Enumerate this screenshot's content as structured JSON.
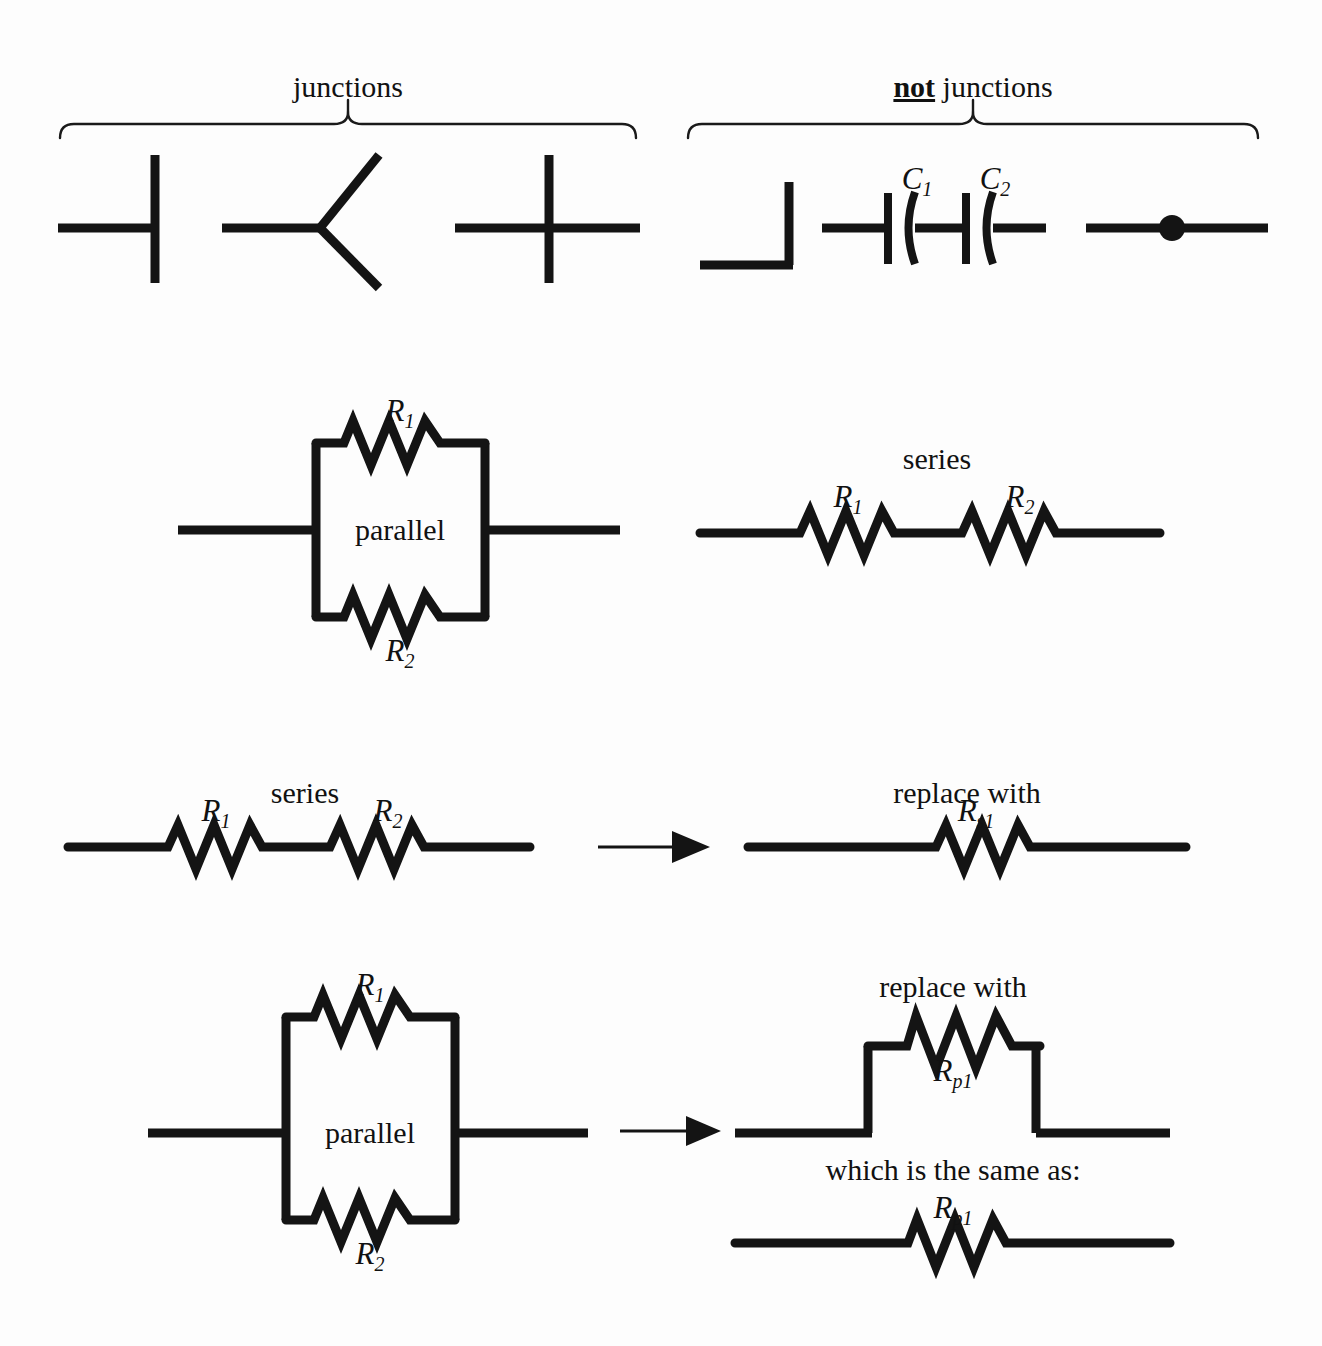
{
  "figure": {
    "title_top_left": "junctions",
    "title_top_right_emphasis": "not",
    "title_top_right_rest": " junctions",
    "background_color": "#fdfdfd",
    "ink_color": "#141414"
  },
  "sections": {
    "junctions": {
      "heading": "junctions",
      "symbols": [
        {
          "name": "t-junction",
          "kind": "tee"
        },
        {
          "name": "y-junction",
          "kind": "wye"
        },
        {
          "name": "cross-junction",
          "kind": "cross"
        }
      ]
    },
    "not_junctions": {
      "heading_emphasis": "not",
      "heading_rest": " junctions",
      "symbols": [
        {
          "name": "corner-wire",
          "kind": "elbow"
        },
        {
          "name": "series-capacitors",
          "kind": "capacitors",
          "labels": [
            "C",
            "C"
          ],
          "subscripts": [
            "1",
            "2"
          ]
        },
        {
          "name": "wire-with-dot",
          "kind": "dot-on-wire"
        }
      ]
    },
    "parallel_vs_series": {
      "parallel": {
        "box_label": "parallel",
        "top_resistor": {
          "symbol": "R",
          "subscript": "1"
        },
        "bottom_resistor": {
          "symbol": "R",
          "subscript": "2"
        }
      },
      "series": {
        "heading": "series",
        "resistors": [
          {
            "symbol": "R",
            "subscript": "1"
          },
          {
            "symbol": "R",
            "subscript": "2"
          }
        ]
      }
    },
    "series_reduction": {
      "left_heading": "series",
      "left_resistors": [
        {
          "symbol": "R",
          "subscript": "1"
        },
        {
          "symbol": "R",
          "subscript": "2"
        }
      ],
      "arrow": "right-arrow",
      "right_heading": "replace with",
      "right_resistor": {
        "symbol": "R",
        "subscript": "s1"
      }
    },
    "parallel_reduction": {
      "left_box_label": "parallel",
      "left_top_resistor": {
        "symbol": "R",
        "subscript": "1"
      },
      "left_bottom_resistor": {
        "symbol": "R",
        "subscript": "2"
      },
      "arrow": "right-arrow",
      "right_heading": "replace with",
      "right_resistor": {
        "symbol": "R",
        "subscript": "p1"
      },
      "equivalence_heading": "which is the same as:",
      "equivalent_resistor": {
        "symbol": "R",
        "subscript": "p1"
      }
    }
  },
  "labels": {
    "junctions": "junctions",
    "not_word": "not",
    "junctions_suffix": " junctions",
    "C": "C",
    "sub1": "1",
    "sub2": "2",
    "R": "R",
    "subs1": "s1",
    "subp1": "p1",
    "parallel": "parallel",
    "series": "series",
    "replace_with": "replace with",
    "same_as": "which is the same as:"
  }
}
